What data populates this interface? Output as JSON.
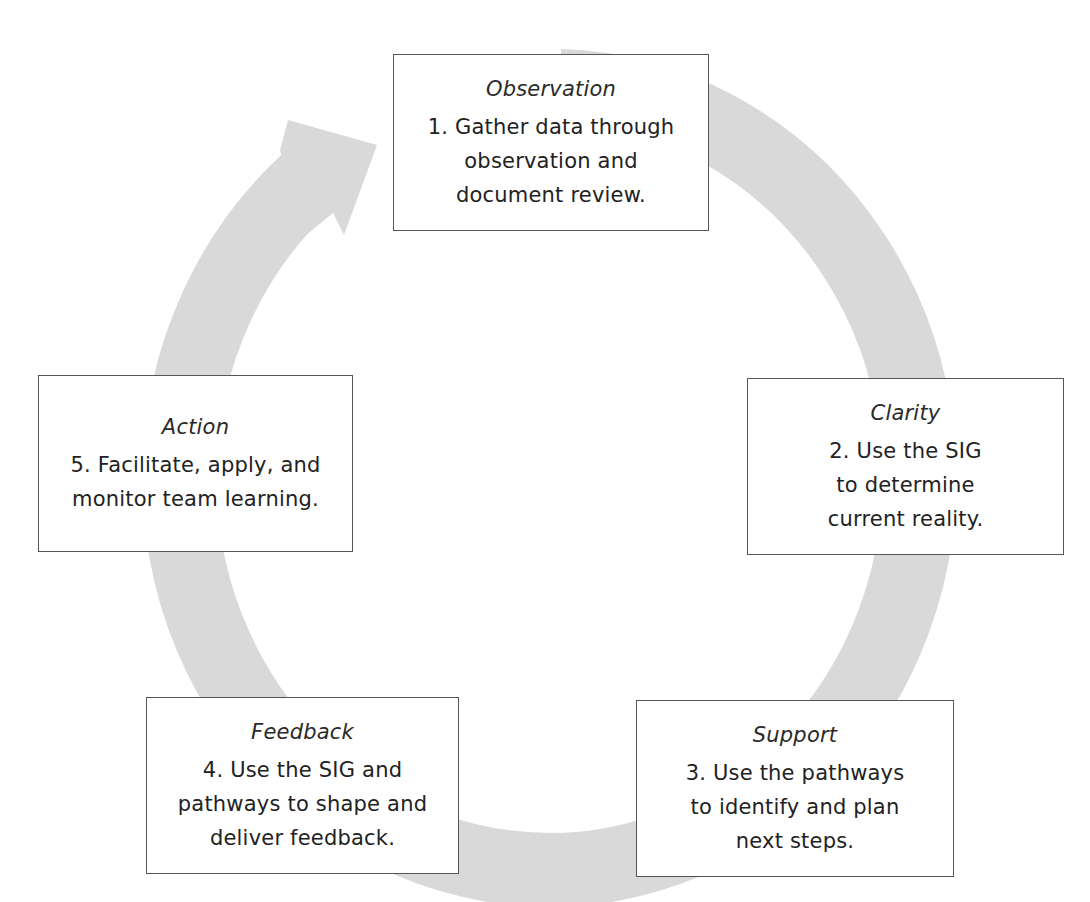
{
  "diagram": {
    "type": "cycle",
    "ring_color": "#d9d9d9",
    "border_color": "#555555",
    "text_color": "#222222",
    "steps": [
      {
        "id": "observation",
        "title": "Observation",
        "lines": [
          "1. Gather data through",
          "observation and",
          "document review."
        ]
      },
      {
        "id": "clarity",
        "title": "Clarity",
        "lines": [
          "2. Use the SIG",
          "to determine",
          "current reality."
        ]
      },
      {
        "id": "support",
        "title": "Support",
        "lines": [
          "3. Use the pathways",
          "to identify and plan",
          "next steps."
        ]
      },
      {
        "id": "feedback",
        "title": "Feedback",
        "lines": [
          "4. Use the SIG and",
          "pathways to shape and",
          "deliver feedback."
        ]
      },
      {
        "id": "action",
        "title": "Action",
        "lines": [
          "5. Facilitate, apply, and",
          "monitor team learning."
        ]
      }
    ]
  }
}
